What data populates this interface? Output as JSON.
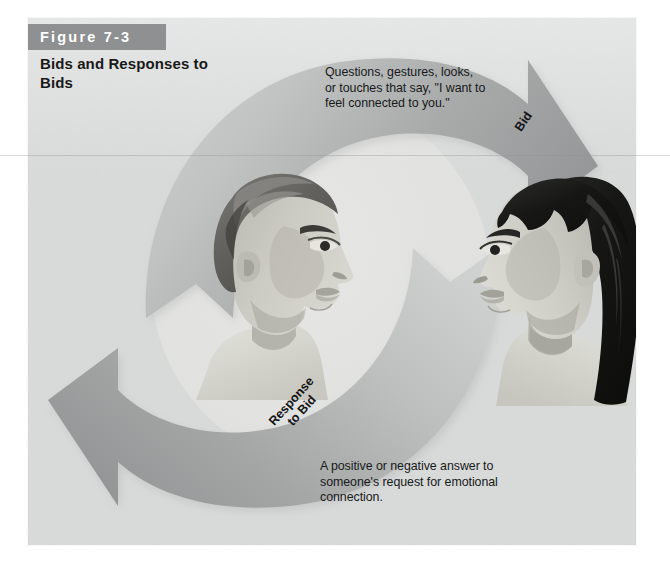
{
  "figure": {
    "badge_label": "Figure 7-3",
    "title": "Bids and\nResponses to\nBids"
  },
  "diagram": {
    "type": "cycle",
    "bid_caption": "Questions, gestures, looks,\nor touches that say, \"I want to\nfeel connected to you.\"",
    "bid_arrow_label": "Bid",
    "response_caption": "A positive or negative answer to\nsomeone's request for emotional\nconnection.",
    "response_arrow_label": "Response\nto Bid",
    "figures": [
      {
        "name": "man-profile",
        "facing": "right"
      },
      {
        "name": "woman-profile",
        "facing": "left"
      }
    ]
  },
  "colors": {
    "panel_background": "#d9dbda",
    "badge_background": "#8e9091",
    "badge_text": "#ffffff",
    "arrow_dark": "#9a9c9d",
    "arrow_light": "#c6c8c7",
    "body_text": "#17191a",
    "hair_dark": "#1a1a1a",
    "hair_mid": "#6a6a68",
    "skin": "#c9c9c2"
  }
}
